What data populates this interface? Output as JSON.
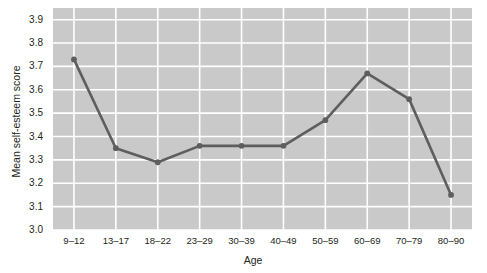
{
  "chart_data": {
    "type": "line",
    "title": "",
    "xlabel": "Age",
    "ylabel": "Mean self-esteem score",
    "categories": [
      "9–12",
      "13–17",
      "18–22",
      "23–29",
      "30–39",
      "40–49",
      "50–59",
      "60–69",
      "70–79",
      "80–90"
    ],
    "values": [
      3.73,
      3.35,
      3.29,
      3.36,
      3.36,
      3.36,
      3.47,
      3.67,
      3.56,
      3.15
    ],
    "ylim": [
      3.0,
      3.95
    ],
    "yticks": [
      "3.0",
      "3.1",
      "3.2",
      "3.3",
      "3.4",
      "3.5",
      "3.6",
      "3.7",
      "3.8",
      "3.9"
    ],
    "ytick_values": [
      3.0,
      3.1,
      3.2,
      3.3,
      3.4,
      3.5,
      3.6,
      3.7,
      3.8,
      3.9
    ],
    "grid": true,
    "legend": "none",
    "series": [
      {
        "name": "Mean self-esteem score",
        "values": [
          3.73,
          3.35,
          3.29,
          3.36,
          3.36,
          3.36,
          3.47,
          3.67,
          3.56,
          3.15
        ]
      }
    ],
    "colors": {
      "plot_background": "#c9c9c9",
      "gridline": "#ffffff",
      "line": "#5e5e5e",
      "marker": "#5e5e5e",
      "text": "#231f20",
      "figure_background": "#ffffff"
    }
  }
}
